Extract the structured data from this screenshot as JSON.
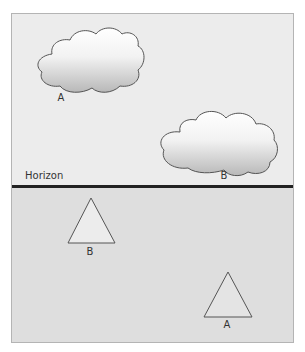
{
  "scene": {
    "horizon_label": "Horizon",
    "clouds": [
      {
        "label": "A"
      },
      {
        "label": "B"
      }
    ],
    "triangles": [
      {
        "label": "B"
      },
      {
        "label": "A"
      }
    ]
  },
  "colors": {
    "sky": "#ececec",
    "ground": "#dedede",
    "horizon": "#222222",
    "outline": "#555555"
  }
}
